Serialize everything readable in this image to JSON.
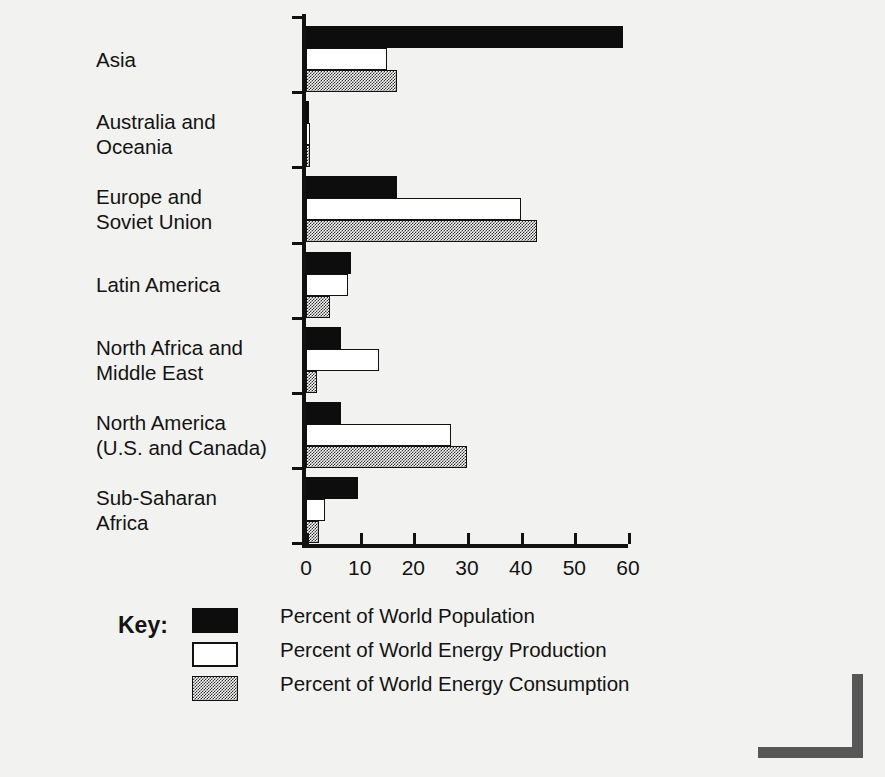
{
  "chart_data": {
    "type": "bar",
    "orientation": "horizontal",
    "title": "",
    "xlabel": "",
    "ylabel": "Region",
    "xlim": [
      0,
      60
    ],
    "xticks": [
      0,
      10,
      20,
      30,
      40,
      50,
      60
    ],
    "grid": false,
    "legend_position": "bottom-left",
    "legend_title": "Key:",
    "categories": [
      "Asia",
      "Australia and Oceania",
      "Europe and Soviet Union",
      "Latin America",
      "North Africa and Middle East",
      "North America (U.S. and Canada)",
      "Sub-Saharan Africa"
    ],
    "series": [
      {
        "name": "Percent of World Population",
        "style": "solid-black",
        "color": "#0d0d0d",
        "values": [
          59,
          0.5,
          17,
          8.4,
          6.5,
          6.6,
          9.7
        ]
      },
      {
        "name": "Percent of World Energy Production",
        "style": "outline-white",
        "color": "#ffffff",
        "values": [
          15,
          0.8,
          40,
          7.8,
          13.6,
          27,
          3.6
        ]
      },
      {
        "name": "Percent of World Energy Consumption",
        "style": "gray-dither",
        "color": "#8a8a8a",
        "values": [
          17,
          0.8,
          43,
          4.5,
          2.0,
          30,
          2.5
        ]
      }
    ]
  },
  "axis": {
    "y_title": "Region",
    "x_tick_labels": [
      "0",
      "10",
      "20",
      "30",
      "40",
      "50",
      "60"
    ]
  },
  "category_labels": [
    [
      "Asia"
    ],
    [
      "Australia and",
      "Oceania"
    ],
    [
      "Europe and",
      "Soviet Union"
    ],
    [
      "Latin America"
    ],
    [
      "North Africa and",
      "Middle East"
    ],
    [
      "North America",
      "(U.S. and Canada)"
    ],
    [
      "Sub-Saharan",
      "Africa"
    ]
  ],
  "legend": {
    "title": "Key:",
    "items": [
      "Percent of World Population",
      "Percent of World Energy Production",
      "Percent of World Energy Consumption"
    ]
  },
  "colors": {
    "population": "#0d0d0d",
    "production": "#ffffff",
    "consumption": "#8a8a8a",
    "axis": "#111111",
    "background": "#f2f2f0",
    "corner_bracket": "#575757"
  }
}
